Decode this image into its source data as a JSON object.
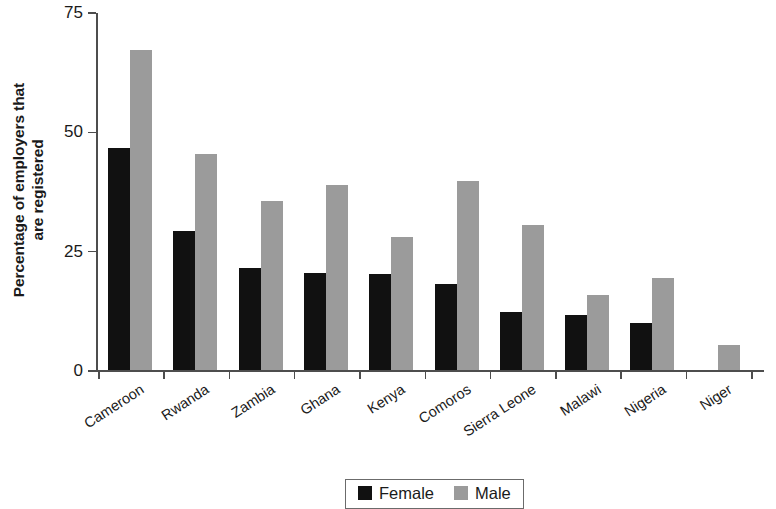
{
  "chart_data": {
    "type": "bar",
    "title": "",
    "subtitle": "",
    "xlabel": "",
    "ylabel": "Percentage of employers that are registered",
    "ylabel_line1": "Percentage of employers that",
    "ylabel_line2": "are registered",
    "ylim": [
      0,
      75
    ],
    "yticks": [
      0,
      25,
      50,
      75
    ],
    "ytick_labels": [
      "0",
      "25",
      "50",
      "75"
    ],
    "grid": false,
    "legend_position": "bottom-center",
    "categories": [
      "Cameroon",
      "Rwanda",
      "Zambia",
      "Ghana",
      "Kenya",
      "Comoros",
      "Sierra Leone",
      "Malawi",
      "Nigeria",
      "Niger"
    ],
    "series": [
      {
        "name": "Female",
        "color": "#111111",
        "values": [
          46.6,
          29.2,
          21.4,
          20.4,
          20.2,
          18.1,
          12.2,
          11.6,
          9.8,
          0
        ]
      },
      {
        "name": "Male",
        "color": "#9b9b9b",
        "values": [
          67.0,
          45.2,
          35.5,
          38.8,
          27.9,
          39.5,
          30.4,
          15.8,
          19.2,
          5.2
        ]
      }
    ]
  },
  "legend": {
    "items": [
      {
        "label": "Female",
        "color": "#111111"
      },
      {
        "label": "Male",
        "color": "#9b9b9b"
      }
    ]
  },
  "colors": {
    "female": "#111111",
    "male": "#9b9b9b",
    "axis": "#4d4d4d",
    "text": "#1a1a1a",
    "background": "#ffffff"
  }
}
